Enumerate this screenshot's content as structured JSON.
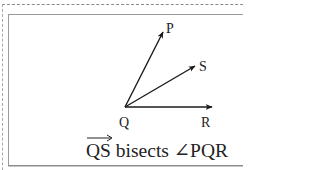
{
  "diagram": {
    "type": "angle-bisector",
    "vertex": {
      "label": "Q",
      "x": 125,
      "y": 107
    },
    "rays": [
      {
        "name": "QP",
        "endpoint_label": "P",
        "tip": [
          163,
          32
        ]
      },
      {
        "name": "QS",
        "endpoint_label": "S",
        "tip": [
          195,
          66
        ]
      },
      {
        "name": "QR",
        "endpoint_label": "R",
        "tip": [
          211,
          107
        ]
      }
    ],
    "labels": {
      "P": "P",
      "S": "S",
      "Q": "Q",
      "R": "R"
    },
    "caption": {
      "vector": "QS",
      "text": " bisects ∠PQR"
    },
    "colors": {
      "stroke": "#1a1a1a",
      "border": "#9a9a9a",
      "dashed_border": "#8a8a8a"
    }
  }
}
